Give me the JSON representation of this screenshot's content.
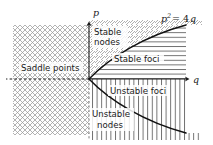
{
  "figure": {
    "type": "diagram",
    "title": "",
    "axes": {
      "x_label": "q",
      "y_label": "p",
      "x_axis_name": "q-axis",
      "y_axis_name": "p-axis",
      "origin_label": ""
    },
    "curve": {
      "equation_base": "p",
      "equation_exponent": "2",
      "equation_rest": "= 4",
      "equation_var": "q",
      "equation_full": "p2 = 4q",
      "name": "discriminant-parabola"
    },
    "regions": [
      {
        "id": "saddle-points",
        "label": "Saddle points",
        "label_lines": [
          "Saddle points"
        ],
        "hatch": "cross-hatch",
        "color": "#8c8c8c"
      },
      {
        "id": "stable-nodes",
        "label": "Stable nodes",
        "label_lines": [
          "Stable",
          "nodes"
        ],
        "hatch": "diagonal-up",
        "color": "#8c8c8c"
      },
      {
        "id": "stable-foci",
        "label": "Stable foci",
        "label_lines": [
          "Stable foci"
        ],
        "hatch": "horizontal",
        "color": "#4d4d4d"
      },
      {
        "id": "unstable-foci",
        "label": "Unstable foci",
        "label_lines": [
          "Unstable foci"
        ],
        "hatch": "vertical",
        "color": "#4d4d4d"
      },
      {
        "id": "unstable-nodes",
        "label": "Unstable nodes",
        "label_lines": [
          "Unstable",
          "nodes"
        ],
        "hatch": "vertical",
        "color": "#4d4d4d"
      }
    ],
    "colors": {
      "background": "#ffffff",
      "ink": "#1a1a1a",
      "hatch_light": "#9a9a9a",
      "hatch_dark": "#4a4a4a"
    }
  }
}
